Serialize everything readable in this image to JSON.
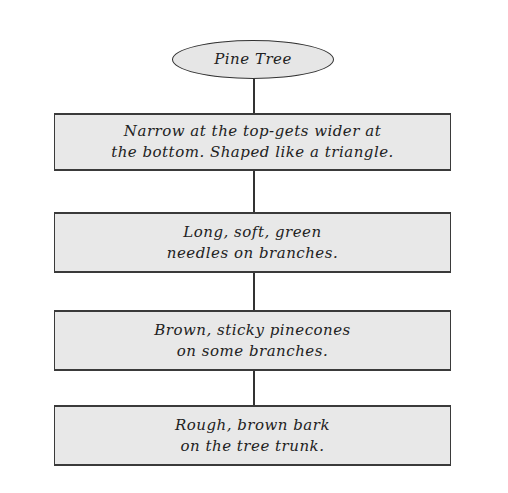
{
  "diagram": {
    "title": "Pine Tree",
    "nodes": [
      {
        "lines": [
          "Narrow at the top-gets wider at",
          "the bottom. Shaped like a triangle."
        ]
      },
      {
        "lines": [
          "Long, soft, green",
          "needles on branches."
        ]
      },
      {
        "lines": [
          "Brown, sticky pinecones",
          "on some branches."
        ]
      },
      {
        "lines": [
          "Rough, brown bark",
          "on the tree trunk."
        ]
      }
    ],
    "colors": {
      "fill": "#e8e8e8",
      "stroke": "#333333",
      "text": "#222222",
      "background": "#ffffff"
    }
  }
}
